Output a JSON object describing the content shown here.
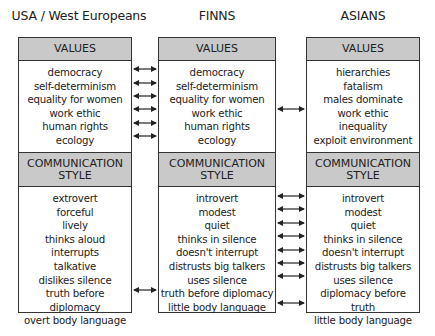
{
  "columns": [
    {
      "title": "USA / West Europeans",
      "values_header": "VALUES",
      "values": [
        "democracy",
        "self-determinism",
        "equality for women",
        "work ethic",
        "human rights",
        "ecology"
      ],
      "comm_header_line1": "COMMUNICATION",
      "comm_header_line2": "STYLE",
      "communication": [
        "extrovert",
        "forceful",
        "lively",
        "thinks aloud",
        "interrupts",
        "talkative",
        "dislikes silence",
        "truth before diplomacy",
        "overt body language"
      ]
    },
    {
      "title": "FINNS",
      "values_header": "VALUES",
      "values": [
        "democracy",
        "self-determinism",
        "equality for women",
        "work ethic",
        "human rights",
        "ecology"
      ],
      "comm_header_line1": "COMMUNICATION",
      "comm_header_line2": "STYLE",
      "communication": [
        "introvert",
        "modest",
        "quiet",
        "thinks in silence",
        "doesn't interrupt",
        "distrusts big talkers",
        "uses silence",
        "truth before diplomacy",
        "little body language"
      ]
    },
    {
      "title": "ASIANS",
      "values_header": "VALUES",
      "values": [
        "hierarchies",
        "fatalism",
        "males dominate",
        "work ethic",
        "inequality",
        "exploit environment"
      ],
      "comm_header_line1": "COMMUNICATION",
      "comm_header_line2": "STYLE",
      "communication": [
        "introvert",
        "modest",
        "quiet",
        "thinks in silence",
        "doesn't interrupt",
        "distrusts big talkers",
        "uses silence",
        "diplomacy before truth",
        "little body language"
      ]
    }
  ],
  "links": {
    "usa_finns_values_rows": [
      0,
      1,
      2,
      3,
      4,
      5
    ],
    "finns_asians_values_rows": [
      3
    ],
    "usa_finns_comm_rows": [
      7
    ],
    "finns_asians_comm_rows": [
      0,
      1,
      2,
      3,
      4,
      5,
      6,
      8
    ]
  },
  "colors": {
    "header_fill": "#c9c9c9",
    "border": "#333333",
    "text": "#222222"
  }
}
